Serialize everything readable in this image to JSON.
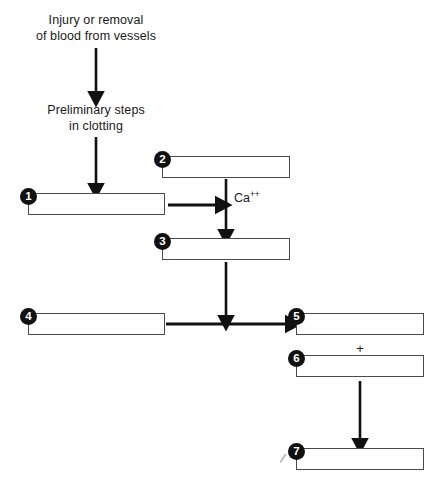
{
  "diagram": {
    "background_color": "#ffffff",
    "box_border_color": "#4a4a4a",
    "badge_color": "#111111",
    "arrow_color": "#111111",
    "captions": [
      {
        "id": "injury-caption",
        "line1": "Injury or removal",
        "line2": "of blood from vessels"
      },
      {
        "id": "preliminary-caption",
        "line1": "Preliminary steps",
        "line2": "in clotting"
      }
    ],
    "catalyst_label": {
      "base": "Ca",
      "charge": "++"
    },
    "plus_symbol": "+",
    "blanks": [
      {
        "number": "1",
        "label": "blank-answer-box-1",
        "value": ""
      },
      {
        "number": "2",
        "label": "blank-answer-box-2",
        "value": ""
      },
      {
        "number": "3",
        "label": "blank-answer-box-3",
        "value": ""
      },
      {
        "number": "4",
        "label": "blank-answer-box-4",
        "value": ""
      },
      {
        "number": "5",
        "label": "blank-answer-box-5",
        "value": ""
      },
      {
        "number": "6",
        "label": "blank-answer-box-6",
        "value": ""
      },
      {
        "number": "7",
        "label": "blank-answer-box-7",
        "value": ""
      }
    ],
    "arrows": [
      {
        "id": "arrow-injury-to-preliminary",
        "direction": "down"
      },
      {
        "id": "arrow-preliminary-to-box1",
        "direction": "down"
      },
      {
        "id": "arrow-box1-to-calcium",
        "direction": "right"
      },
      {
        "id": "arrow-box2-to-box3",
        "direction": "down"
      },
      {
        "id": "arrow-box3-to-box5",
        "direction": "down"
      },
      {
        "id": "arrow-box4-to-box5",
        "direction": "right"
      },
      {
        "id": "arrow-box6-to-box7",
        "direction": "down"
      }
    ]
  }
}
